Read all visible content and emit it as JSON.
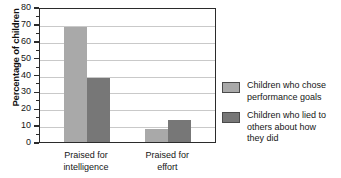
{
  "chart_data": {
    "type": "bar",
    "title": "",
    "subtitle": "",
    "xlabel": "",
    "ylabel": "Percentage of children",
    "categories": [
      "Praised for intelligence",
      "Praised for effort"
    ],
    "category_lines": [
      [
        "Praised for",
        "intelligence"
      ],
      [
        "Praised for",
        "effort"
      ]
    ],
    "series": [
      {
        "name": "Children who chose performance goals",
        "name_lines": [
          "Children who chose",
          "performance goals"
        ],
        "color": "#a9a9a9",
        "values": [
          68,
          8
        ]
      },
      {
        "name": "Children who lied to others about how they did",
        "name_lines": [
          "Children who lied to",
          "others about how",
          "they did"
        ],
        "color": "#777777",
        "values": [
          38,
          13
        ]
      }
    ],
    "ylim": [
      0,
      80
    ],
    "ytick_values": [
      0,
      10,
      20,
      30,
      40,
      50,
      60,
      70,
      80
    ],
    "ytick_labels": [
      "0",
      "10",
      "20",
      "30",
      "40",
      "50",
      "60",
      "70",
      "80"
    ],
    "yminor_values": [
      5,
      15,
      25,
      35,
      45,
      55,
      65,
      75
    ],
    "grid": true,
    "grid_axis": "y",
    "legend_position": "right",
    "frame_color": "#2b2b2b",
    "grid_color": "#c9c9c9",
    "background": "#ffffff"
  }
}
